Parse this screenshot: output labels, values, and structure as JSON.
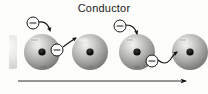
{
  "figure": {
    "title": "Conductor",
    "type": "physics-diagram",
    "background_color": "#fdfdfc",
    "width": 208,
    "height": 94
  },
  "atoms": [
    {
      "id": "atom-edge-left",
      "label": "",
      "cx": 12,
      "cy": 52,
      "r": 17,
      "partial": true,
      "clipped_side": "left",
      "nucleus": false
    },
    {
      "id": "atom-1",
      "label": "",
      "cx": 42,
      "cy": 52,
      "r": 18,
      "partial": false,
      "nucleus": true
    },
    {
      "id": "atom-2",
      "label": "",
      "cx": 90,
      "cy": 52,
      "r": 18,
      "partial": false,
      "nucleus": true
    },
    {
      "id": "atom-3",
      "label": "",
      "cx": 137,
      "cy": 52,
      "r": 18,
      "partial": false,
      "nucleus": true
    },
    {
      "id": "atom-4",
      "label": "",
      "cx": 190,
      "cy": 52,
      "r": 18,
      "partial": true,
      "clipped_side": "right",
      "nucleus": true
    }
  ],
  "electrons": [
    {
      "id": "electron-1",
      "symbol": "minus",
      "cx": 33,
      "cy": 23,
      "r": 6,
      "state": "incoming"
    },
    {
      "id": "electron-2",
      "symbol": "minus",
      "cx": 57,
      "cy": 50,
      "r": 6,
      "state": "bound"
    },
    {
      "id": "electron-3",
      "symbol": "minus",
      "cx": 120,
      "cy": 26,
      "r": 6,
      "state": "incoming"
    },
    {
      "id": "electron-4",
      "symbol": "minus",
      "cx": 152,
      "cy": 61,
      "r": 6,
      "state": "bound"
    }
  ],
  "hop_arrows": [
    {
      "id": "hop-arrow-1",
      "from": "electron-1",
      "to": "atom-1"
    },
    {
      "id": "hop-arrow-2",
      "from": "atom-1",
      "to": "atom-2"
    },
    {
      "id": "hop-arrow-3",
      "from": "electron-3",
      "to": "atom-3"
    },
    {
      "id": "hop-arrow-4",
      "from": "atom-3",
      "to": "atom-4"
    }
  ],
  "current_arrow": {
    "id": "current-direction-arrow",
    "label": "",
    "direction": "right",
    "x_start": 18,
    "x_end": 188,
    "y": 81
  },
  "colors": {
    "sphere_light": "#e8e8e6",
    "sphere_mid": "#a9a9a6",
    "sphere_dark": "#6e6e6b",
    "nucleus": "#141414",
    "stroke": "#1a1a1a",
    "title_text": "#1a1a1a"
  }
}
